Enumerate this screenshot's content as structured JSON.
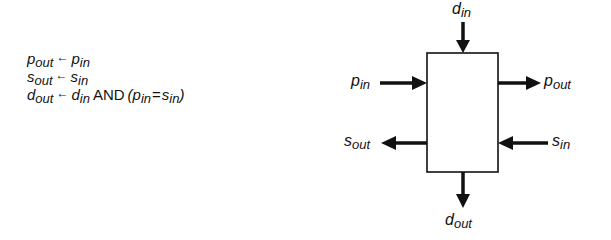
{
  "equations": [
    {
      "lhs": {
        "base": "p",
        "sub": "out"
      },
      "arrow": "←",
      "rhs": [
        {
          "base": "p",
          "sub": "in"
        }
      ]
    },
    {
      "lhs": {
        "base": "s",
        "sub": "out"
      },
      "arrow": "←",
      "rhs": [
        {
          "base": "s",
          "sub": "in"
        }
      ]
    },
    {
      "lhs": {
        "base": "d",
        "sub": "out"
      },
      "arrow": "←",
      "rhs_first": {
        "base": "d",
        "sub": "in"
      },
      "operator": "AND",
      "open_paren": "(",
      "cmp_left": {
        "base": "p",
        "sub": "in"
      },
      "cmp_op": "=",
      "cmp_right": {
        "base": "s",
        "sub": "in"
      },
      "close_paren": ")"
    }
  ],
  "block": {
    "inputs": {
      "top": {
        "base": "d",
        "sub": "in"
      },
      "left": {
        "base": "p",
        "sub": "in"
      },
      "right": {
        "base": "s",
        "sub": "in"
      }
    },
    "outputs": {
      "bottom": {
        "base": "d",
        "sub": "out"
      },
      "right": {
        "base": "p",
        "sub": "out"
      },
      "left": {
        "base": "s",
        "sub": "out"
      }
    }
  },
  "colors": {
    "ink": "#111111",
    "background": "#ffffff"
  }
}
